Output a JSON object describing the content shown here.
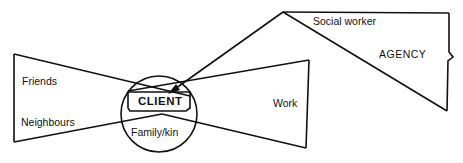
{
  "diagram": {
    "type": "network-diagram",
    "colors": {
      "stroke": "#111111",
      "background": "#ffffff"
    },
    "center": {
      "label": "CLIENT"
    },
    "inner_circle": {
      "label": "Family/kin"
    },
    "left_network": {
      "labels": [
        "Friends",
        "Neighbours"
      ]
    },
    "right_network": {
      "label": "Work"
    },
    "agency": {
      "label": "AGENCY",
      "apex_label": "Social worker"
    },
    "connections": [
      {
        "from": "Social worker",
        "to": "CLIENT",
        "style": "arrow"
      }
    ]
  }
}
